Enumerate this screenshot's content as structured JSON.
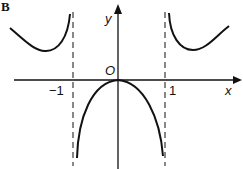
{
  "panel_label": "B",
  "axes": {
    "x_label": "x",
    "y_label": "y",
    "origin_label": "O",
    "ticks": [
      {
        "value": -1,
        "label": "−1"
      },
      {
        "value": 1,
        "label": "1"
      }
    ]
  },
  "asymptotes": [
    {
      "x": -1,
      "style": "dashed"
    },
    {
      "x": 1,
      "style": "dashed"
    }
  ],
  "curves": [
    {
      "name": "left-branch",
      "description": "above x-axis, left of x=-1, minimum then rising to +infinity near x=-1"
    },
    {
      "name": "middle-branch",
      "description": "between asymptotes, maximum at origin (0,0), falling to -infinity toward x=-1 and x=1"
    },
    {
      "name": "right-branch",
      "description": "above x-axis, right of x=1, descending from +infinity to a minimum then rising"
    }
  ],
  "colors": {
    "stroke": "#111111",
    "background": "#ffffff"
  }
}
